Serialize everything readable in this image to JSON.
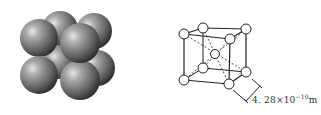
{
  "figure": {
    "left_panel": {
      "description": "space-filling model of body-centered cubic unit cell",
      "sphere_color": "#7a7a7a"
    },
    "right_panel": {
      "description": "ball-and-stick model of body-centered cubic unit cell",
      "edge_length_label": {
        "mantissa": "4. 28×10",
        "exponent": "−10",
        "unit": "m"
      }
    }
  }
}
